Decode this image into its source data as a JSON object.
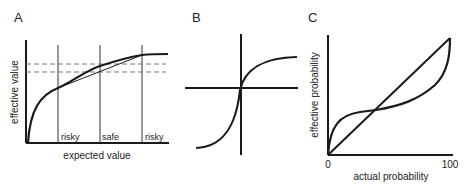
{
  "panels": {
    "A": {
      "letter": "A",
      "ylabel": "effective value",
      "xlabel": "expected value",
      "region_labels": [
        "risky",
        "safe",
        "risky"
      ]
    },
    "B": {
      "letter": "B"
    },
    "C": {
      "letter": "C",
      "ylabel": "effective probability",
      "xlabel": "actual probability",
      "x_tick_min": "0",
      "x_tick_max": "100"
    }
  },
  "colors": {
    "line": "#1a1a1a",
    "dashed": "#777777",
    "text": "#222222"
  }
}
